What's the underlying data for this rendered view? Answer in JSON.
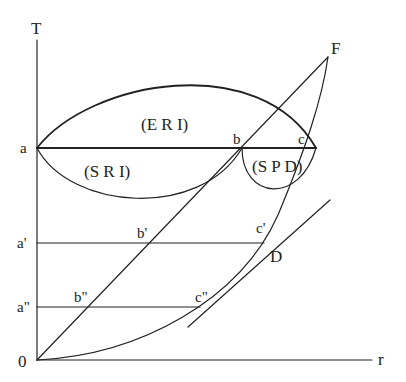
{
  "diagram": {
    "type": "temperature-radius phase diagram",
    "axes": {
      "y_label": "T",
      "x_label": "r",
      "origin_label": "0"
    },
    "points": {
      "a": "a",
      "b": "b",
      "c": "c",
      "a1": "a'",
      "b1": "b'",
      "c1": "c'",
      "a2": "a\"",
      "b2": "b\"",
      "c2": "c\"",
      "F": "F",
      "D": "D"
    },
    "regions": {
      "eri": "(E R I)",
      "sri": "(S R I)",
      "spd": "(S P D)"
    },
    "colors": {
      "line": "#222222",
      "background": "#ffffff"
    }
  }
}
